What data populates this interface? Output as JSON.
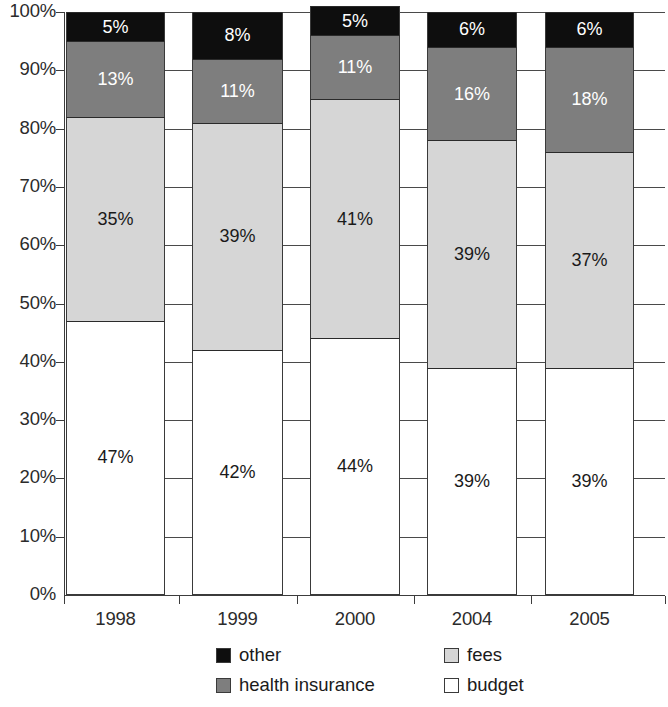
{
  "chart_data": {
    "type": "bar",
    "stacked": true,
    "stack_total": 100,
    "title": "",
    "subtitle": "",
    "xlabel": "",
    "ylabel": "",
    "categories": [
      "1998",
      "1999",
      "2000",
      "2004",
      "2005"
    ],
    "ylim": [
      0,
      100
    ],
    "ytick_labels": [
      "0%",
      "10%",
      "20%",
      "30%",
      "40%",
      "50%",
      "60%",
      "70%",
      "80%",
      "90%",
      "100%"
    ],
    "ytick_values": [
      0,
      10,
      20,
      30,
      40,
      50,
      60,
      70,
      80,
      90,
      100
    ],
    "grid": true,
    "grid_orientation": "horizontal",
    "legend_position": "bottom",
    "value_labels_suffix": "%",
    "series": [
      {
        "name": "budget",
        "color": "#ffffff",
        "values": [
          47,
          42,
          44,
          39,
          39
        ],
        "labels": [
          "47%",
          "42%",
          "44%",
          "39%",
          "39%"
        ]
      },
      {
        "name": "fees",
        "color": "#d6d6d6",
        "values": [
          35,
          39,
          41,
          39,
          37
        ],
        "labels": [
          "35%",
          "39%",
          "41%",
          "39%",
          "37%"
        ]
      },
      {
        "name": "health insurance",
        "color": "#7e7e7e",
        "values": [
          13,
          11,
          11,
          16,
          18
        ],
        "labels": [
          "13%",
          "11%",
          "11%",
          "16%",
          "18%"
        ]
      },
      {
        "name": "other",
        "color": "#0e0e0e",
        "values": [
          5,
          8,
          5,
          6,
          6
        ],
        "labels": [
          "5%",
          "8%",
          "5%",
          "6%",
          "6%"
        ]
      }
    ]
  },
  "legend": {
    "entries": [
      {
        "label": "other",
        "color": "#0e0e0e"
      },
      {
        "label": "fees",
        "color": "#d6d6d6"
      },
      {
        "label": "health insurance",
        "color": "#7e7e7e"
      },
      {
        "label": "budget",
        "color": "#ffffff"
      }
    ]
  }
}
